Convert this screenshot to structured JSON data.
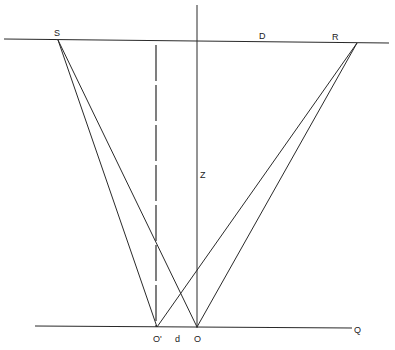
{
  "diagram": {
    "labels": {
      "S": "S",
      "D": "D",
      "R": "R",
      "Z": "Z",
      "O_prime": "O'",
      "d": "d",
      "O": "O",
      "Q": "Q"
    },
    "colors": {
      "line": "#2a2a2a",
      "background": "#ffffff"
    }
  }
}
